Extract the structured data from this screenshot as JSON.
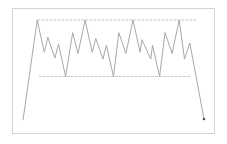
{
  "diagram": {
    "kind": "price-range-breakdown",
    "colors": {
      "frame": "#d4d4d4",
      "price_line": "#a8a8a8",
      "level_line": "#c4c4c4",
      "end_marker": "#555555"
    },
    "y_scale": {
      "min": 0,
      "max": 100,
      "note": "relative units, 100 = resistance top, 0 = bottom of chart area"
    },
    "resistance_level": 87,
    "support_level": 38,
    "price_path": [
      {
        "x": 0,
        "y": 0
      },
      {
        "x": 8,
        "y": 87
      },
      {
        "x": 12,
        "y": 59
      },
      {
        "x": 14,
        "y": 72
      },
      {
        "x": 18,
        "y": 54
      },
      {
        "x": 20,
        "y": 66
      },
      {
        "x": 24,
        "y": 38
      },
      {
        "x": 28,
        "y": 76
      },
      {
        "x": 31,
        "y": 58
      },
      {
        "x": 35,
        "y": 87
      },
      {
        "x": 39,
        "y": 59
      },
      {
        "x": 41,
        "y": 71
      },
      {
        "x": 45,
        "y": 53
      },
      {
        "x": 47,
        "y": 65
      },
      {
        "x": 51,
        "y": 38
      },
      {
        "x": 54,
        "y": 76
      },
      {
        "x": 58,
        "y": 58
      },
      {
        "x": 62,
        "y": 87
      },
      {
        "x": 66,
        "y": 59
      },
      {
        "x": 67,
        "y": 70
      },
      {
        "x": 72,
        "y": 53
      },
      {
        "x": 73,
        "y": 65
      },
      {
        "x": 77,
        "y": 38
      },
      {
        "x": 80,
        "y": 76
      },
      {
        "x": 84,
        "y": 58
      },
      {
        "x": 88,
        "y": 87
      },
      {
        "x": 91,
        "y": 53
      },
      {
        "x": 94,
        "y": 67
      },
      {
        "x": 102,
        "y": 1
      }
    ],
    "x_scale": {
      "min": 0,
      "max": 102
    },
    "resistance_span": {
      "x_start": 8,
      "x_end": 98
    },
    "support_span": {
      "x_start": 9,
      "x_end": 94
    },
    "end_marker": true
  }
}
